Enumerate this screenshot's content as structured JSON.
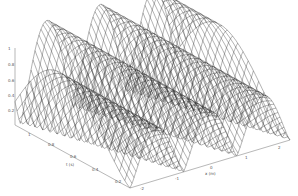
{
  "chart_data": {
    "type": "surface-wireframe",
    "title": "",
    "function": "z = A * |sin(k*x)| style traveling wave surface (3 crests visible)",
    "axes": {
      "z": {
        "label": "",
        "ticks": [
          "0",
          "0.2",
          "0.4",
          "0.6",
          "0.8",
          "1"
        ],
        "range": [
          0,
          1
        ]
      },
      "y": {
        "label": "t (s)",
        "ticks": [
          "1",
          "0.8",
          "0.6",
          "0.4",
          "0.2",
          "0"
        ]
      },
      "x": {
        "label": "x (m)",
        "ticks": [
          "-2",
          "-1",
          "0",
          "1",
          "2"
        ]
      }
    },
    "crests": 3,
    "grid": false,
    "legend": null,
    "line_color": "#222222",
    "background": "#ffffff"
  },
  "labels": {
    "z_ticks": [
      "1",
      "0.8",
      "0.6",
      "0.4",
      "0.2",
      "0"
    ],
    "y_ticks": [
      "1",
      "0.8",
      "0.6",
      "0.4",
      "0.2"
    ],
    "x_ticks": [
      "-2",
      "-1",
      "0",
      "1",
      "2"
    ],
    "y_axis_label": "t (s)",
    "x_axis_label": "x (m)"
  }
}
